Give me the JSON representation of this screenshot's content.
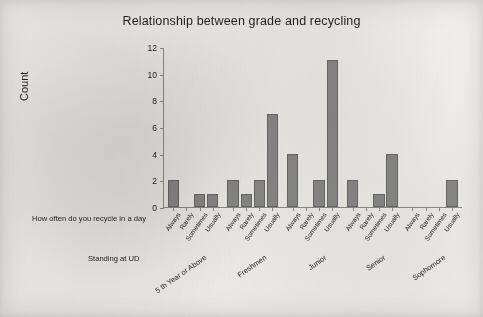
{
  "chart_data": {
    "type": "bar",
    "title": "Relationship between grade and recycling",
    "xlabel": "",
    "ylabel": "Count",
    "ylim": [
      0,
      12
    ],
    "yticks": [
      0,
      2,
      4,
      6,
      8,
      10,
      12
    ],
    "grid": false,
    "legend": null,
    "axis_captions": {
      "inner": "How often do you recycle in a day",
      "outer": "Standing at UD"
    },
    "categories": [
      "Always",
      "Rarely",
      "Sometimes",
      "Usually"
    ],
    "groups": [
      "5 th Year or Above",
      "Freshmen",
      "Junior",
      "Senior",
      "Sophomore"
    ],
    "series": [
      {
        "name": "5 th Year or Above",
        "values": [
          2,
          0,
          1,
          1
        ]
      },
      {
        "name": "Freshmen",
        "values": [
          2,
          1,
          2,
          7
        ]
      },
      {
        "name": "Junior",
        "values": [
          4,
          0,
          2,
          11
        ]
      },
      {
        "name": "Senior",
        "values": [
          2,
          0,
          1,
          4
        ]
      },
      {
        "name": "Sophomore",
        "values": [
          0,
          0,
          0,
          2
        ]
      }
    ],
    "colors": {
      "bar_fill": "#8b8b8b",
      "bar_stroke": "#6a6a6a",
      "axis": "#8e8e8e",
      "text": "#232323",
      "background": "#f2f1ee"
    }
  }
}
